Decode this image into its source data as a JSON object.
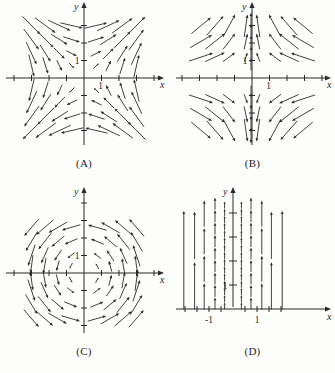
{
  "figure": {
    "background_color": "#fdfdfc",
    "ink_color": "#2b2b2b",
    "panel_count": 4
  },
  "panels": [
    {
      "id": "A",
      "caption": "(A)",
      "x_axis_label": "x",
      "y_axis_label": "y",
      "x_tick_label": "1",
      "y_tick_label": "1",
      "field_description": "rotational-saddle field; arrows sweep clockwise in upper half and counterclockwise sense along lower half"
    },
    {
      "id": "B",
      "caption": "(B)",
      "x_axis_label": "x",
      "y_axis_label": "y",
      "x_tick_label": "1",
      "y_tick_label": "1",
      "field_description": "arrows converge horizontally toward the y-axis; vertical arrows along the y-axis"
    },
    {
      "id": "C",
      "caption": "(C)",
      "x_axis_label": "x",
      "y_axis_label": "y",
      "x_tick_label": "",
      "y_tick_label": "1",
      "field_description": "counterclockwise spiral / vortex field about the origin"
    },
    {
      "id": "D",
      "caption": "(D)",
      "x_axis_label": "x",
      "y_axis_label": "y",
      "x_tick_labels": [
        "-1",
        "1"
      ],
      "y_tick_label": "1",
      "field_description": "purely vertical upward arrows whose length varies with x, shortest near x = 0 and x near the plotted band edges"
    }
  ],
  "chart_data": {
    "type": "scatter",
    "subtitle": "",
    "xlabel": "x",
    "ylabel": "y",
    "grid": false,
    "legend_position": "none",
    "panels": [
      {
        "id": "A",
        "label": "(A)",
        "xlim": [
          -4.2,
          4.2
        ],
        "ylim": [
          -4.2,
          4.2
        ],
        "x_ticks": [
          -4,
          -3,
          -2,
          -1,
          1,
          2,
          3,
          4
        ],
        "y_ticks": [
          -4,
          -3,
          -2,
          -1,
          1,
          2,
          3,
          4
        ],
        "tick_labels_shown": {
          "x": [
            "1"
          ],
          "y": [
            "1"
          ]
        },
        "field_formula_u": "y",
        "field_formula_v": "x",
        "sample_x": [
          -3,
          -2,
          -1,
          0,
          1,
          2,
          3
        ],
        "sample_y": [
          -3,
          -2,
          -1,
          0,
          1,
          2,
          3
        ],
        "arrow_scale": 0.42
      },
      {
        "id": "B",
        "label": "(B)",
        "xlim": [
          -4.2,
          4.2
        ],
        "ylim": [
          -4.2,
          4.2
        ],
        "x_ticks": [
          -4,
          -3,
          -2,
          -1,
          1,
          2,
          3,
          4
        ],
        "y_ticks": [
          -4,
          -3,
          -2,
          -1,
          1,
          2,
          3,
          4
        ],
        "tick_labels_shown": {
          "x": [
            "1"
          ],
          "y": [
            "1"
          ]
        },
        "field_formula_u": "-x",
        "field_formula_v": "y",
        "sample_x": [
          -3,
          -2,
          -1,
          0,
          1,
          2,
          3
        ],
        "sample_y": [
          -3,
          -2,
          -1,
          1,
          2,
          3
        ],
        "arrow_scale": 0.42
      },
      {
        "id": "C",
        "label": "(C)",
        "xlim": [
          -4.2,
          4.2
        ],
        "ylim": [
          -4.2,
          4.2
        ],
        "x_ticks": [
          -4,
          -3,
          -2,
          -1,
          1,
          2,
          3,
          4
        ],
        "y_ticks": [
          -4,
          -3,
          -2,
          -1,
          1,
          2,
          3,
          4
        ],
        "tick_labels_shown": {
          "x": [],
          "y": [
            "1"
          ]
        },
        "field_formula_u": "-y",
        "field_formula_v": "x",
        "sample_x": [
          -3,
          -2,
          -1,
          0,
          1,
          2,
          3
        ],
        "sample_y": [
          -3,
          -2,
          -1,
          0,
          1,
          2,
          3
        ],
        "arrow_scale": 0.4
      },
      {
        "id": "D",
        "label": "(D)",
        "xlim": [
          -2.4,
          2.4
        ],
        "ylim": [
          -0.3,
          5.2
        ],
        "x_ticks": [
          -2,
          -1.5,
          -1,
          -0.5,
          0.5,
          1,
          1.5,
          2
        ],
        "y_ticks": [
          1,
          2,
          3,
          4
        ],
        "tick_labels_shown": {
          "x": [
            "-1",
            "1"
          ],
          "y": [
            "1"
          ]
        },
        "field_formula_u": "0",
        "field_formula_v": "x^2",
        "arrow_columns": [
          {
            "x": -2.05,
            "arrow_length_units": 4.4,
            "count": 1
          },
          {
            "x": -1.6,
            "arrow_length_units": 2.1,
            "count": 2
          },
          {
            "x": -1.2,
            "arrow_length_units": 1.15,
            "count": 4
          },
          {
            "x": -0.75,
            "arrow_length_units": 0.52,
            "count": 9
          },
          {
            "x": -0.35,
            "arrow_length_units": 0.3,
            "count": 15
          },
          {
            "x": 0.35,
            "arrow_length_units": 0.3,
            "count": 15
          },
          {
            "x": 0.75,
            "arrow_length_units": 0.52,
            "count": 9
          },
          {
            "x": 1.2,
            "arrow_length_units": 1.15,
            "count": 4
          },
          {
            "x": 1.6,
            "arrow_length_units": 2.1,
            "count": 2
          },
          {
            "x": 2.05,
            "arrow_length_units": 4.4,
            "count": 1
          }
        ]
      }
    ]
  }
}
